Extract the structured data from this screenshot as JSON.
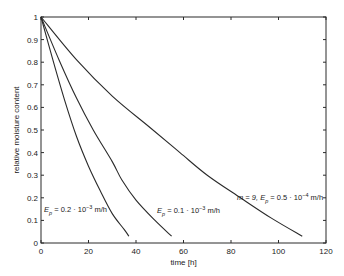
{
  "chart_data": {
    "type": "line",
    "title": "",
    "xlabel": "time [h]",
    "ylabel": "relative moisture content",
    "xlim": [
      0,
      120
    ],
    "ylim": [
      0,
      1
    ],
    "grid": false,
    "legend": "none (inline annotations)",
    "x_ticks": [
      "0",
      "20",
      "40",
      "60",
      "80",
      "100",
      "120"
    ],
    "y_ticks": [
      "0",
      "0.1",
      "0.2",
      "0.3",
      "0.4",
      "0.5",
      "0.6",
      "0.7",
      "0.8",
      "0.9",
      "1"
    ],
    "series": [
      {
        "name": "E_p = 0.2·10^-3 m/h",
        "x": [
          0,
          5,
          10,
          15,
          20,
          25,
          30,
          35,
          37
        ],
        "y": [
          1.0,
          0.81,
          0.63,
          0.47,
          0.34,
          0.23,
          0.13,
          0.06,
          0.03
        ]
      },
      {
        "name": "E_p = 0.1·10^-3 m/h",
        "x": [
          0,
          7.6,
          15,
          22,
          30,
          34,
          40,
          48,
          55
        ],
        "y": [
          1.0,
          0.81,
          0.64,
          0.5,
          0.36,
          0.28,
          0.19,
          0.1,
          0.03
        ]
      },
      {
        "name": "m = 9, E_p = 0.5·10^-4 m/h",
        "x": [
          0,
          15,
          30,
          46,
          58.5,
          70,
          84,
          97,
          110
        ],
        "y": [
          1.0,
          0.81,
          0.65,
          0.51,
          0.4,
          0.3,
          0.2,
          0.11,
          0.03
        ]
      }
    ],
    "annotations": [
      {
        "text_main": "E",
        "sub": "p",
        "rest": " = 0.2 · 10",
        "sup": "−3",
        "unit": " m/h",
        "x_px": 44,
        "y_px": 212
      },
      {
        "text_main": "E",
        "sub": "p",
        "rest": " = 0.1 · 10",
        "sup": "−3",
        "unit": " m/h",
        "x_px": 157,
        "y_px": 213
      },
      {
        "text_main": "m = 9,  E",
        "sub": "p",
        "rest": " = 0.5 · 10",
        "sup": "−4",
        "unit": " m/h",
        "x_px": 237,
        "y_px": 200
      }
    ]
  },
  "labels": {
    "xlabel": "time [h]",
    "ylabel": "relative moisture content"
  },
  "colors": {
    "line": "#2a2a2a",
    "axis": "#2a2a2a",
    "background": "#ffffff"
  }
}
